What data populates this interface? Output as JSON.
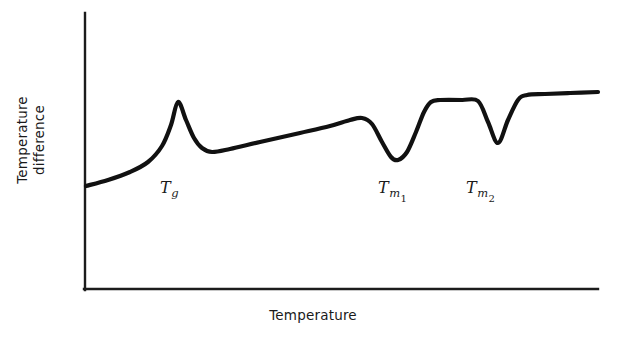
{
  "figure": {
    "background_color": "#ffffff",
    "ink_color": "#111111"
  },
  "axes": {
    "y_title_line1": "Temperature",
    "y_title_line2": "difference",
    "x_title": "Temperature",
    "origin_x": 85,
    "origin_y": 289,
    "y_axis_top": 13,
    "x_axis_right": 598
  },
  "annotations": [
    {
      "id": "tg",
      "symbol": "T",
      "sub": "g",
      "sub2": "",
      "x": 160,
      "y": 178
    },
    {
      "id": "tm1",
      "symbol": "T",
      "sub": "m",
      "sub2": "1",
      "x": 378,
      "y": 178
    },
    {
      "id": "tm2",
      "symbol": "T",
      "sub": "m",
      "sub2": "2",
      "x": 466,
      "y": 178
    }
  ],
  "chart_data": {
    "type": "line",
    "title": "",
    "xlabel": "Temperature",
    "ylabel": "Temperature difference",
    "grid": false,
    "legend": null,
    "axis_ticks": {
      "x": [],
      "y": []
    },
    "series": [
      {
        "name": "DTA thermogram",
        "description": "Differential thermal analysis trace showing a glass transition exotherm at Tg, an endothermic melting dip at Tm1, and a second endothermic melting dip at Tm2.",
        "points_px": [
          [
            86,
            186
          ],
          [
            108,
            180
          ],
          [
            130,
            172
          ],
          [
            148,
            162
          ],
          [
            162,
            146
          ],
          [
            171,
            125
          ],
          [
            178,
            102
          ],
          [
            186,
            120
          ],
          [
            194,
            138
          ],
          [
            202,
            148
          ],
          [
            212,
            152
          ],
          [
            230,
            149
          ],
          [
            260,
            142
          ],
          [
            300,
            133
          ],
          [
            330,
            126
          ],
          [
            350,
            120
          ],
          [
            362,
            118
          ],
          [
            372,
            124
          ],
          [
            382,
            142
          ],
          [
            391,
            157
          ],
          [
            398,
            160
          ],
          [
            407,
            152
          ],
          [
            416,
            132
          ],
          [
            424,
            112
          ],
          [
            431,
            102
          ],
          [
            440,
            100
          ],
          [
            462,
            100
          ],
          [
            478,
            101
          ],
          [
            488,
            122
          ],
          [
            498,
            143
          ],
          [
            508,
            120
          ],
          [
            518,
            100
          ],
          [
            527,
            95
          ],
          [
            545,
            94
          ],
          [
            570,
            93
          ],
          [
            598,
            92
          ]
        ],
        "features": [
          {
            "label": "Tg",
            "type": "exothermic-peak",
            "x_px": 178,
            "y_px": 102
          },
          {
            "label": "Tm1",
            "type": "endothermic-dip",
            "x_px": 398,
            "y_px": 160
          },
          {
            "label": "Tm2",
            "type": "endothermic-dip",
            "x_px": 498,
            "y_px": 143
          }
        ]
      }
    ]
  }
}
